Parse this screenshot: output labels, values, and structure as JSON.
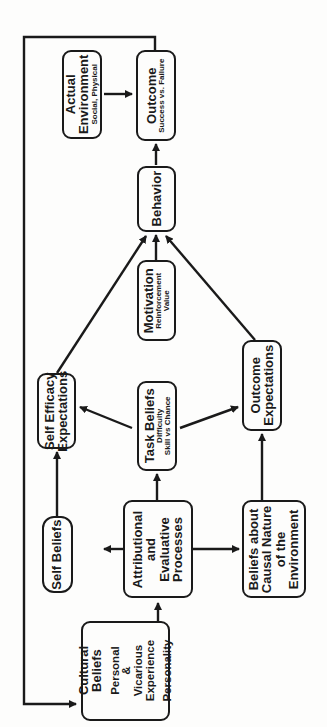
{
  "diagram": {
    "orientation": "rotated-90-ccw",
    "nodes": {
      "cultural": {
        "lines": [
          "Cultural",
          "Beliefs"
        ],
        "lines2": [
          "Personal",
          "&",
          "Vicarious",
          "Experience"
        ],
        "lines3": [
          "Personality"
        ]
      },
      "self_beliefs": {
        "title": "Self Beliefs"
      },
      "attributional": {
        "lines": [
          "Attributional",
          "and",
          "Evaluative",
          "Processes"
        ]
      },
      "causal": {
        "lines": [
          "Beliefs about",
          "Causal Nature",
          "of the",
          "Environment"
        ]
      },
      "task_beliefs": {
        "title": "Task Beliefs",
        "sub1": "Difficulty",
        "sub2": "Skill vs Chance"
      },
      "self_efficacy": {
        "lines": [
          "Self Efficacy",
          "Expectations"
        ]
      },
      "outcome_expectations": {
        "lines": [
          "Outcome",
          "Expectations"
        ]
      },
      "motivation": {
        "title": "Motivation",
        "sub1": "Reinforcement",
        "sub2": "Value"
      },
      "behavior": {
        "title": "Behavior"
      },
      "outcome": {
        "title": "Outcome",
        "sub1": "Success vs. Failure"
      },
      "actual_environment": {
        "lines": [
          "Actual",
          "Environment"
        ],
        "sub1": "Social, Physical"
      }
    },
    "edges": [
      [
        "Cultural Beliefs",
        "Attributional and Evaluative Processes"
      ],
      [
        "Attributional and Evaluative Processes",
        "Self Beliefs"
      ],
      [
        "Attributional and Evaluative Processes",
        "Task Beliefs"
      ],
      [
        "Attributional and Evaluative Processes",
        "Beliefs about Causal Nature of the Environment"
      ],
      [
        "Self Beliefs",
        "Self Efficacy Expectations"
      ],
      [
        "Task Beliefs",
        "Self Efficacy Expectations"
      ],
      [
        "Task Beliefs",
        "Outcome Expectations"
      ],
      [
        "Beliefs about Causal Nature of the Environment",
        "Outcome Expectations"
      ],
      [
        "Self Efficacy Expectations",
        "Behavior"
      ],
      [
        "Motivation",
        "Behavior"
      ],
      [
        "Outcome Expectations",
        "Behavior"
      ],
      [
        "Behavior",
        "Outcome"
      ],
      [
        "Actual Environment",
        "Outcome"
      ],
      [
        "Outcome",
        "Cultural Beliefs"
      ]
    ]
  }
}
